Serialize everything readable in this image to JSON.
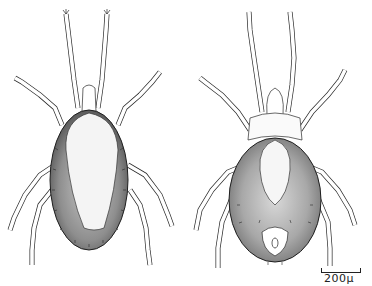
{
  "figure": {
    "views": [
      {
        "name": "dorsal",
        "position": "left"
      },
      {
        "name": "ventral",
        "position": "right"
      }
    ],
    "scale_bar": {
      "label": "200μ"
    },
    "colors": {
      "ink": "#2a2a2a",
      "shade": "#8a8a8a",
      "shade_light": "#b8b8b8",
      "background": "#ffffff"
    }
  }
}
